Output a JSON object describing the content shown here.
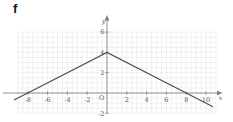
{
  "figure_label": "f",
  "colors": {
    "background": "#ffffff",
    "grid": "#e3e6e3",
    "axis": "#7a7a7a",
    "tick_text": "#565656",
    "curve": "#4c4c4c",
    "figure_label_text": "#1a1a1a"
  },
  "chart_data": {
    "type": "line",
    "title": "",
    "xlabel": "x",
    "ylabel": "y",
    "origin_label": "O",
    "xlim": [
      -9,
      11
    ],
    "ylim": [
      -2,
      6
    ],
    "grid": true,
    "grid_step": 0.5,
    "x_ticks": [
      -8,
      -6,
      -4,
      -2,
      2,
      4,
      6,
      8,
      10
    ],
    "y_ticks": [
      -2,
      2,
      4,
      6
    ],
    "legend": false,
    "series": [
      {
        "name": "f",
        "points": [
          [
            -9.4,
            -0.7
          ],
          [
            -8,
            0
          ],
          [
            0,
            4
          ],
          [
            8,
            0
          ],
          [
            10.7,
            -1.35
          ]
        ],
        "peak": [
          0,
          4
        ],
        "x_intercepts": [
          -8,
          8
        ],
        "y_intercept": 4
      }
    ]
  }
}
